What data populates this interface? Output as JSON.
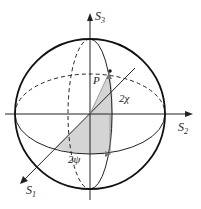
{
  "diagram": {
    "axes": {
      "s1": {
        "label": "S",
        "sub": "1"
      },
      "s2": {
        "label": "S",
        "sub": "2"
      },
      "s3": {
        "label": "S",
        "sub": "3"
      }
    },
    "point": {
      "label": "P"
    },
    "angles": {
      "chi": "2χ",
      "psi": "2ψ"
    },
    "colors": {
      "line": "#222222",
      "shade": "#d4d4d4",
      "background": "#ffffff"
    }
  }
}
